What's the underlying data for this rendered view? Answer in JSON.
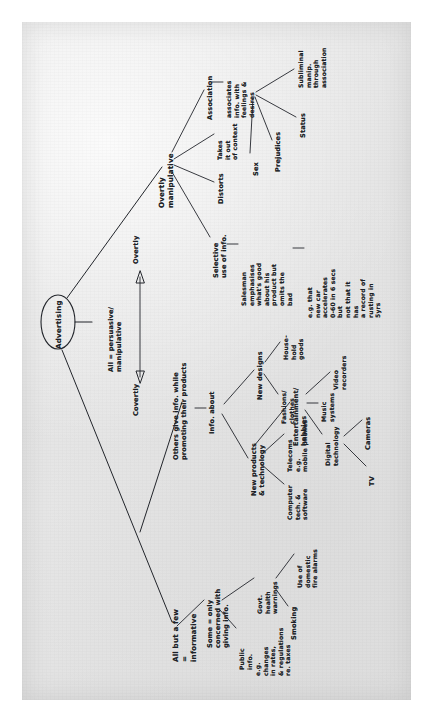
{
  "document": {
    "kind": "handwritten-mind-map",
    "medium": "pencil on paper, scanned",
    "orientation": "rotated 90 degrees counter-clockwise (text reads bottom-to-top)",
    "root": "Advertising"
  },
  "nodes": {
    "root": "Advertising",
    "axis_label": "All = persuasive/\nmanipulative",
    "axis_left": "Covertly",
    "axis_right": "Overtly",
    "informative_header": "All but a few\n=\ninformative",
    "some_only": "Some = only\nconcerned with\ngiving info.",
    "public_info": "Public\ninfo.",
    "eg_changes": "e.g.\nchanges\nin rates,\n& regulations\nre. taxes",
    "govt_health": "Govt.\nhealth\nwarnings",
    "smoking": "Smoking",
    "fire_alarms": "Use of\ndomestic\nfire alarms",
    "covertly": "Covertly",
    "others_give": "Others give info. while\npromoting their products",
    "info_about": "Info. about",
    "new_products": "New products\n& technology",
    "telecoms": "Telecoms\ne.g.\nmobile phones",
    "computer_tech": "Computer\ntech. &\nsoftware",
    "new_designs": "New designs",
    "household_goods": "House-\nhold\ngoods",
    "fashions_clothes": "Fashions/\nclothes",
    "entertainment": "Entertainment/\nhobbies",
    "video_recorders": "Video\nrecorders",
    "music_systems": "Music\nsystems",
    "digital_technology": "Digital\ntechnology",
    "cameras": "Cameras",
    "tv": "TV",
    "overtly": "Overtly",
    "overtly_manipulative": "Overtly\nmanipulative",
    "selective_use": "Selective\nuse of info.",
    "salesman": "Salesman\nemphasises\nwhat's good\nabout his\nproduct but\nomits the\nbad",
    "eg_car": "e.g. that\nnew car\naccelerates\n0-60 in 6 secs\nbut\nnot that it\nhas\na record of\nrusting in\n5yrs",
    "distorts": "Distorts",
    "takes_out_of_context": "Takes\nit out\nof context",
    "association": "Association",
    "associates_info": "associates\ninfo. with\nfeelings &\ndesires",
    "subliminal": "Subliminal\nmanip.\nthrough\nassociation",
    "status": "Status",
    "prejudices": "Prejudices",
    "sex": "Sex"
  },
  "style": {
    "paper_color": "#e5e5e5",
    "ink_color": "#1c1f26",
    "page_background": "#ffffff"
  }
}
